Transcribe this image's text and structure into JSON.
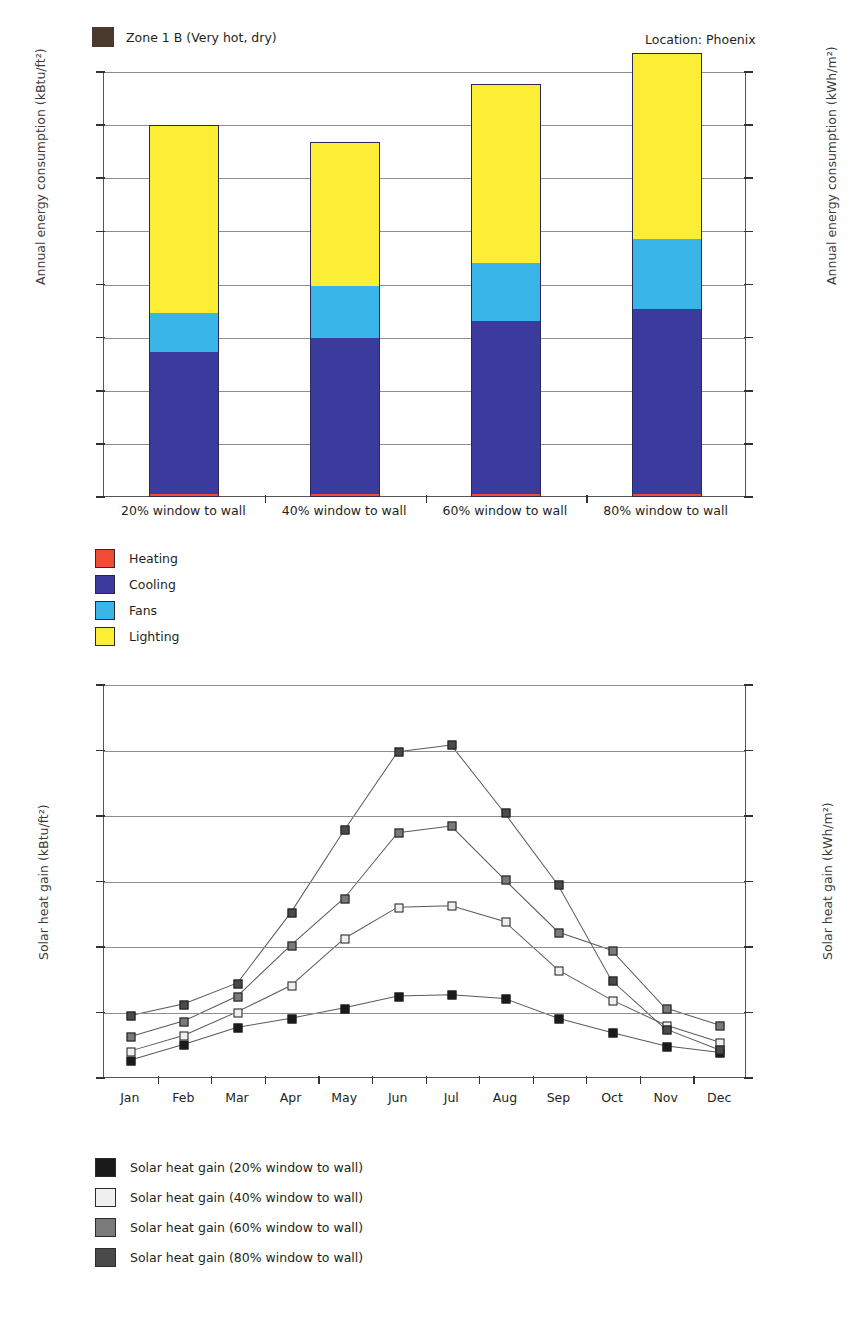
{
  "header": {
    "zone_label": "Zone 1 B (Very hot, dry)",
    "zone_swatch_color": "#4a3a2e",
    "location_label": "Location:  Phoenix"
  },
  "chart_data": [
    {
      "type": "bar",
      "id": "annual-energy-consumption",
      "stacked": true,
      "title": "",
      "xlabel": "",
      "ylabel": "Annual energy consumption (kBtu/ft²)",
      "ylabel_right": "Annual energy consumption (kWh/m²)",
      "categories": [
        "20% window to wall",
        "40% window to wall",
        "60% window to wall",
        "80% window to wall"
      ],
      "ylim": [
        0,
        100
      ],
      "yticks": [
        "0",
        "12.5",
        "25.0",
        "37.5",
        "50.0",
        "62.5",
        "75.0",
        "87.5",
        "100.0"
      ],
      "ytick_values": [
        0,
        12.5,
        25,
        37.5,
        50,
        62.5,
        75,
        87.5,
        100
      ],
      "yticks_right": [
        "0",
        "40",
        "79",
        "118",
        "158",
        "197",
        "237",
        "276",
        "315"
      ],
      "ytick_values_right": [
        0,
        40,
        79,
        118,
        158,
        197,
        237,
        276,
        315
      ],
      "ylim_right": [
        0,
        315
      ],
      "grid": true,
      "legend_position": "below-left",
      "series": [
        {
          "name": "Heating",
          "color": "#f04b35",
          "values": [
            0.4,
            0.4,
            0.4,
            0.4
          ]
        },
        {
          "name": "Cooling",
          "color": "#3b3b9e",
          "values": [
            33.4,
            36.9,
            40.8,
            43.6
          ]
        },
        {
          "name": "Fans",
          "color": "#39b5e8",
          "values": [
            9.3,
            12.2,
            13.6,
            16.5
          ]
        },
        {
          "name": "Lighting",
          "color": "#fcee34",
          "values": [
            43.9,
            33.5,
            41.8,
            43.5
          ]
        }
      ],
      "totals": [
        87.0,
        83.0,
        96.6,
        104.0
      ]
    },
    {
      "type": "line",
      "id": "solar-heat-gain",
      "title": "",
      "xlabel": "",
      "ylabel": "Solar heat gain (kBtu/ft²)",
      "ylabel_right": "Solar heat gain (kWh/m²)",
      "categories": [
        "Jan",
        "Feb",
        "Mar",
        "Apr",
        "May",
        "Jun",
        "Jul",
        "Aug",
        "Sep",
        "Oct",
        "Nov",
        "Dec"
      ],
      "ylim": [
        0,
        3.0
      ],
      "yticks": [
        "0.0",
        "0.5",
        "1.0",
        "1.5",
        "2.0",
        "2.5",
        "3.0"
      ],
      "ytick_values": [
        0,
        0.5,
        1.0,
        1.5,
        2.0,
        2.5,
        3.0
      ],
      "yticks_right": [
        "0",
        "1.6",
        "3.2",
        "4.7",
        "6.3",
        "7.9",
        "9.5"
      ],
      "ytick_values_right": [
        0,
        1.6,
        3.2,
        4.7,
        6.3,
        7.9,
        9.5
      ],
      "ylim_right": [
        0,
        9.5
      ],
      "grid": true,
      "legend_position": "below-left",
      "series": [
        {
          "name": "Solar heat gain (20% window to wall)",
          "marker_color": "#1a1a1a",
          "values": [
            0.13,
            0.25,
            0.38,
            0.45,
            0.53,
            0.62,
            0.63,
            0.6,
            0.45,
            0.34,
            0.24,
            0.19
          ]
        },
        {
          "name": "Solar heat gain (40% window to wall)",
          "marker_color": "#efefef",
          "values": [
            0.2,
            0.32,
            0.5,
            0.7,
            1.06,
            1.3,
            1.31,
            1.19,
            0.82,
            0.59,
            0.4,
            0.27
          ]
        },
        {
          "name": "Solar heat gain (60% window to wall)",
          "marker_color": "#7a7a7a",
          "values": [
            0.31,
            0.43,
            0.62,
            1.01,
            1.37,
            1.87,
            1.92,
            1.51,
            1.11,
            0.97,
            0.53,
            0.4
          ]
        },
        {
          "name": "Solar heat gain (80% window to wall)",
          "marker_color": "#4a4a4a",
          "values": [
            0.47,
            0.56,
            0.72,
            1.26,
            1.89,
            2.49,
            2.54,
            2.02,
            1.47,
            0.74,
            0.37,
            0.21
          ]
        }
      ]
    }
  ],
  "legend1": [
    {
      "label": "Heating",
      "color": "#f04b35"
    },
    {
      "label": "Cooling",
      "color": "#3b3b9e"
    },
    {
      "label": "Fans",
      "color": "#39b5e8"
    },
    {
      "label": "Lighting",
      "color": "#fcee34"
    }
  ],
  "legend2": [
    {
      "label": "Solar heat gain (20% window to wall)",
      "color": "#1a1a1a"
    },
    {
      "label": "Solar heat gain (40% window to wall)",
      "color": "#efefef"
    },
    {
      "label": "Solar heat gain (60% window to wall)",
      "color": "#7a7a7a"
    },
    {
      "label": "Solar heat gain (80% window to wall)",
      "color": "#4a4a4a"
    }
  ],
  "caption": {
    "text": ""
  }
}
